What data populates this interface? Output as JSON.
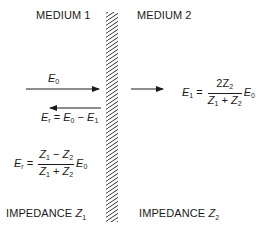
{
  "labels": {
    "medium_left": "MEDIUM 1",
    "medium_right": "MEDIUM 2",
    "impedance_left": "IMPEDANCE",
    "impedance_left_symbol": "Z",
    "impedance_left_sub": "1",
    "impedance_right": "IMPEDANCE",
    "impedance_right_symbol": "Z",
    "impedance_right_sub": "2"
  },
  "equations": {
    "incident": {
      "symbol": "E",
      "sub": "0"
    },
    "reflected_def": {
      "lhs": "E",
      "lhs_sub": "r",
      "eq": " = ",
      "a": "E",
      "a_sub": "0",
      "op": " − ",
      "b": "E",
      "b_sub": "1"
    },
    "transmitted": {
      "lhs": "E",
      "lhs_sub": "1",
      "eq": " = ",
      "num": "2Z",
      "num_sub": "2",
      "den_a": "Z",
      "den_a_sub": "1",
      "den_op": " + ",
      "den_b": "Z",
      "den_b_sub": "2",
      "tail": "E",
      "tail_sub": "0"
    },
    "reflected": {
      "lhs": "E",
      "lhs_sub": "r",
      "eq": " = ",
      "num_a": "Z",
      "num_a_sub": "1",
      "num_op": " − ",
      "num_b": "Z",
      "num_b_sub": "2",
      "den_a": "Z",
      "den_a_sub": "1",
      "den_op": " + ",
      "den_b": "Z",
      "den_b_sub": "2",
      "tail": "E",
      "tail_sub": "0"
    }
  },
  "colors": {
    "ink": "#1a1a1a",
    "background": "#ffffff"
  }
}
